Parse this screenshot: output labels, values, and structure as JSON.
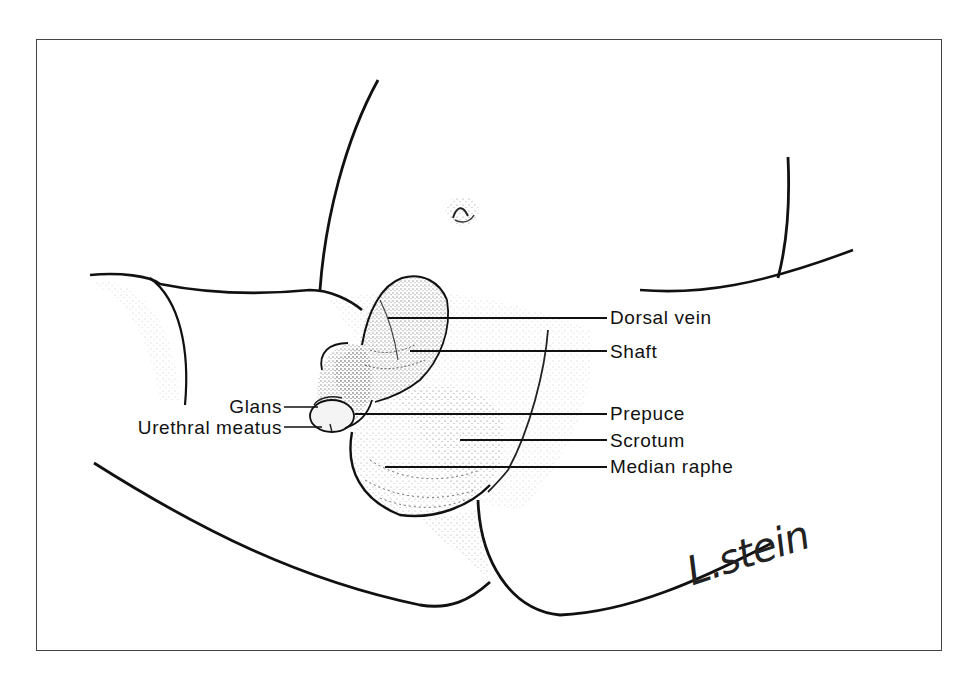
{
  "figure": {
    "type": "anatomical-illustration",
    "frame_color": "#444444",
    "line_color": "#111111",
    "stipple_color": "#555555"
  },
  "labels_right": [
    {
      "id": "dorsal-vein",
      "text": "Dorsal vein",
      "x": 610,
      "y": 308,
      "leader_from_x": 388,
      "leader_y": 318
    },
    {
      "id": "shaft",
      "text": "Shaft",
      "x": 610,
      "y": 342,
      "leader_from_x": 410,
      "leader_y": 351
    },
    {
      "id": "prepuce",
      "text": "Prepuce",
      "x": 610,
      "y": 404,
      "leader_from_x": 355,
      "leader_y": 414
    },
    {
      "id": "scrotum",
      "text": "Scrotum",
      "x": 610,
      "y": 431,
      "leader_from_x": 460,
      "leader_y": 440
    },
    {
      "id": "median-raphe",
      "text": "Median raphe",
      "x": 610,
      "y": 457,
      "leader_from_x": 385,
      "leader_y": 467
    }
  ],
  "labels_left": [
    {
      "id": "glans",
      "text": "Glans",
      "right_x": 282,
      "y": 397,
      "leader_to_x": 318,
      "leader_y": 407
    },
    {
      "id": "urethral-meatus",
      "text": "Urethral meatus",
      "right_x": 282,
      "y": 418,
      "leader_to_x": 322,
      "leader_y": 427
    }
  ],
  "signature": {
    "text": "L.stein"
  }
}
